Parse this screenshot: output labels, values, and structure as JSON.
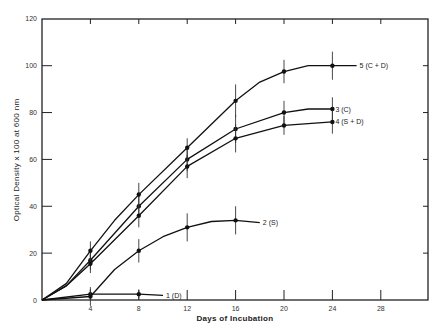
{
  "chart_data": {
    "type": "line",
    "title": "",
    "xlabel": "Days of Incubation",
    "ylabel": "Optical Density x 100 at 600 nm",
    "xlim": [
      0,
      32
    ],
    "ylim": [
      0,
      120
    ],
    "xticks": [
      4,
      8,
      12,
      16,
      20,
      24,
      28
    ],
    "yticks": [
      0,
      20,
      40,
      60,
      80,
      100,
      120
    ],
    "grid": false,
    "legend_position": "inline-right-of-lines",
    "series": [
      {
        "name": "1 (D)",
        "label": "1 (D)",
        "points": [
          [
            0,
            0
          ],
          [
            4,
            2.5
          ],
          [
            8,
            2.5
          ],
          [
            10,
            2
          ]
        ],
        "markers": [
          [
            4,
            2.5
          ],
          [
            8,
            2.5
          ]
        ],
        "error": [
          [
            4,
            2
          ],
          [
            8,
            2
          ]
        ]
      },
      {
        "name": "2 (S)",
        "label": "2 (S)",
        "points": [
          [
            0,
            0
          ],
          [
            4,
            1.5
          ],
          [
            6,
            13
          ],
          [
            8,
            21
          ],
          [
            10,
            27
          ],
          [
            12,
            31
          ],
          [
            14,
            33.5
          ],
          [
            16,
            34
          ],
          [
            18,
            33
          ]
        ],
        "markers": [
          [
            4,
            1.5
          ],
          [
            8,
            21
          ],
          [
            12,
            31
          ],
          [
            16,
            34
          ]
        ],
        "error": [
          [
            4,
            4
          ],
          [
            8,
            5
          ],
          [
            12,
            6
          ],
          [
            16,
            6
          ]
        ]
      },
      {
        "name": "3 (C)",
        "label": "3 (C)",
        "points": [
          [
            0,
            0
          ],
          [
            2,
            6
          ],
          [
            4,
            17
          ],
          [
            8,
            40
          ],
          [
            12,
            60
          ],
          [
            16,
            73
          ],
          [
            20,
            80
          ],
          [
            22,
            81.5
          ],
          [
            24,
            81.5
          ]
        ],
        "markers": [
          [
            4,
            17
          ],
          [
            8,
            40
          ],
          [
            12,
            60
          ],
          [
            16,
            73
          ],
          [
            20,
            80
          ],
          [
            24,
            81.5
          ]
        ],
        "error": [
          [
            4,
            4
          ],
          [
            8,
            5
          ],
          [
            12,
            5
          ],
          [
            16,
            6
          ],
          [
            20,
            5
          ],
          [
            24,
            5
          ]
        ]
      },
      {
        "name": "4 (S+D)",
        "label": "4 (S + D)",
        "points": [
          [
            0,
            0
          ],
          [
            2,
            6
          ],
          [
            4,
            15.5
          ],
          [
            8,
            36
          ],
          [
            12,
            57
          ],
          [
            16,
            69
          ],
          [
            20,
            74.5
          ],
          [
            24,
            76
          ]
        ],
        "markers": [
          [
            4,
            15.5
          ],
          [
            8,
            36
          ],
          [
            12,
            57
          ],
          [
            16,
            69
          ],
          [
            20,
            74.5
          ],
          [
            24,
            76
          ]
        ],
        "error": [
          [
            4,
            4
          ],
          [
            8,
            5
          ],
          [
            12,
            5
          ],
          [
            16,
            6
          ],
          [
            20,
            4
          ],
          [
            24,
            5
          ]
        ]
      },
      {
        "name": "5 (C+D)",
        "label": "5 (C + D)",
        "points": [
          [
            0,
            0
          ],
          [
            2,
            7
          ],
          [
            4,
            21
          ],
          [
            6,
            34
          ],
          [
            8,
            45
          ],
          [
            12,
            65
          ],
          [
            16,
            85
          ],
          [
            18,
            93
          ],
          [
            20,
            97.5
          ],
          [
            22,
            100
          ],
          [
            24,
            100
          ],
          [
            26,
            100
          ]
        ],
        "markers": [
          [
            4,
            21
          ],
          [
            8,
            45
          ],
          [
            12,
            65
          ],
          [
            16,
            85
          ],
          [
            20,
            97.5
          ],
          [
            24,
            100
          ]
        ],
        "error": [
          [
            4,
            4
          ],
          [
            8,
            5
          ],
          [
            12,
            4
          ],
          [
            16,
            7
          ],
          [
            20,
            5
          ],
          [
            24,
            6
          ]
        ]
      }
    ]
  },
  "labels": {
    "xlabel": "Days of Incubation",
    "ylabel": "Optical Density x 100 at 600 nm"
  }
}
